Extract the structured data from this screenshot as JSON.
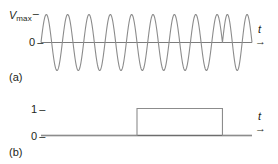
{
  "figure": {
    "panel_a": {
      "caption": "(a)",
      "y_axis_top_label": "V",
      "y_axis_top_subscript": "max",
      "y_axis_zero_label": "0",
      "tick_dash": "–",
      "x_axis_label": "t",
      "x_axis_arrow": "→",
      "stroke_color": "#8c8c8c",
      "baseline_color": "#6d6d6d",
      "text_color": "#231f20"
    },
    "panel_b": {
      "caption": "(b)",
      "y_axis_high_label": "1",
      "y_axis_zero_label": "0",
      "tick_dash": "–",
      "x_axis_label": "t",
      "x_axis_arrow": "→",
      "stroke_color": "#8c8c8c",
      "baseline_color": "#6d6d6d",
      "text_color": "#231f20"
    }
  },
  "chart_data": [
    {
      "type": "line",
      "name": "carrier-waveform",
      "title": "(a)",
      "xlabel": "t",
      "ylabel": "V_max",
      "ytick_labels": [
        "V_max",
        "0"
      ],
      "ytick_values": [
        1,
        0
      ],
      "ylim": [
        -1.15,
        1.15
      ],
      "xlim": [
        0,
        100
      ],
      "grid": false,
      "legend": "none",
      "description": "Sinusoidal carrier with two abrupt 180-degree phase reversals (phase-shift keying), aligned to the rising and falling edges of the digital pulse in panel (b).",
      "amplitude": 1,
      "baseline": 0,
      "cycles_total": 11,
      "phase_shift_x": [
        45.5,
        86.0
      ],
      "segments": [
        {
          "x_start": 0,
          "x_end": 45.5,
          "cycles": 4.5,
          "phase_deg": 0
        },
        {
          "x_start": 45.5,
          "x_end": 86.0,
          "cycles": 4.0,
          "phase_deg": 180
        },
        {
          "x_start": 86.0,
          "x_end": 100,
          "cycles": 1.5,
          "phase_deg": 0
        }
      ]
    },
    {
      "type": "line",
      "name": "digital-pulse",
      "title": "(b)",
      "xlabel": "t",
      "ylabel": "",
      "ytick_labels": [
        "1",
        "0"
      ],
      "ytick_values": [
        1,
        0
      ],
      "ylim": [
        -0.15,
        1.3
      ],
      "xlim": [
        0,
        100
      ],
      "grid": false,
      "legend": "none",
      "description": "Rectangular binary pulse: value 0, then 1 over the middle interval, then back to 0.",
      "x": [
        0,
        45.5,
        45.5,
        86.0,
        86.0,
        100
      ],
      "y": [
        0,
        0,
        1,
        1,
        0,
        0
      ],
      "pulse_start_x": 45.5,
      "pulse_end_x": 86.0,
      "pulse_high_value": 1,
      "pulse_low_value": 0
    }
  ]
}
